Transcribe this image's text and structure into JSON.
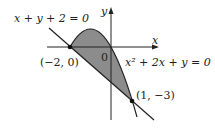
{
  "diagram": {
    "axes": {
      "x_label": "x",
      "y_label": "y",
      "origin_label": "0"
    },
    "curves": [
      {
        "name": "line",
        "equation": "x + y + 2 = 0"
      },
      {
        "name": "parabola",
        "equation": "x² + 2x + y = 0"
      }
    ],
    "points": [
      {
        "label": "(−2, 0)",
        "x": -2,
        "y": 0
      },
      {
        "label": "(1, −3)",
        "x": 1,
        "y": -3
      }
    ],
    "colors": {
      "shade": "#8c8c8c",
      "stroke": "#222222"
    }
  }
}
